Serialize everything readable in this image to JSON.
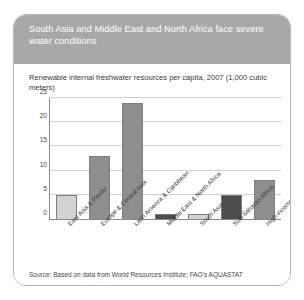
{
  "figure": {
    "title": "South Asia and Middle East and North Africa face severe water conditions",
    "source_note": "Source: Based on data from World Resources Institute; FAO's AQUASTAT",
    "header_color": "#a8a8a8",
    "border_color": "#b9b9b9"
  },
  "chart_data": {
    "type": "bar",
    "title": "Renewable internal freshwater resources per capita, 2007 (1,000 cubic meters)",
    "xlabel": "",
    "ylabel": "",
    "ylim": [
      0,
      25
    ],
    "yticks": [
      0,
      5,
      10,
      15,
      20,
      25
    ],
    "ytick_labels": [
      "0",
      "5",
      "10",
      "15",
      "20",
      "25"
    ],
    "grid": true,
    "legend": "none",
    "categories": [
      "East Asia & Pacific",
      "Europe & Central Asia",
      "Latin America & Caribbean",
      "Middle East & North Africa",
      "South Asia",
      "Sub-Saharan Africa",
      "High-income"
    ],
    "values": [
      5,
      13,
      24,
      1,
      1,
      5,
      8
    ],
    "bar_colors": [
      "#d2d2d2",
      "#8e8e8e",
      "#8e8e8e",
      "#4d4d4d",
      "#d2d2d2",
      "#4d4d4d",
      "#8e8e8e"
    ]
  }
}
